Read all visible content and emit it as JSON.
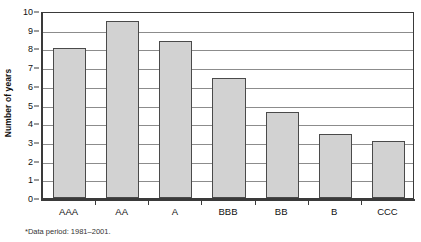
{
  "chart_data": {
    "type": "bar",
    "title": "",
    "xlabel": "",
    "ylabel": "Number of years",
    "categories": [
      "AAA",
      "AA",
      "A",
      "BBB",
      "BB",
      "B",
      "CCC"
    ],
    "values": [
      8.0,
      9.45,
      8.4,
      6.4,
      4.6,
      3.45,
      3.05
    ],
    "ylim": [
      0,
      10
    ],
    "ytick_labels": [
      "10",
      "9",
      "8",
      "7",
      "6",
      "5",
      "4",
      "3",
      "2",
      "1",
      "0"
    ],
    "ytick_values": [
      10,
      9,
      8,
      7,
      6,
      5,
      4,
      3,
      2,
      1,
      0
    ],
    "ytick_step": 1,
    "grid": true,
    "grid_axis": "y",
    "legend": false,
    "legend_position": "none",
    "bar_color": "#d2d2d2",
    "bar_border_color": "#4a4a4a",
    "gridline_color": "#8c8c8c",
    "axis_color": "#3a3a3a",
    "background_color": "#ffffff",
    "footnote": "*Data period: 1981–2001."
  },
  "axes": {
    "y_title": "Number of years"
  },
  "footnote": {
    "text": "*Data period: 1981–2001."
  }
}
